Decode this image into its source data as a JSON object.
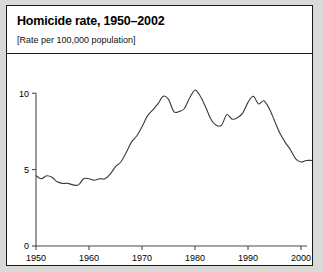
{
  "panel": {
    "title": "Homicide rate, 1950–2002",
    "subtitle": "[Rate per 100,000 population]"
  },
  "chart_data": {
    "type": "line",
    "title": "Homicide rate, 1950–2002",
    "subtitle": "[Rate per 100,000 population]",
    "xlabel": "",
    "ylabel": "",
    "xlim": [
      1950,
      2002
    ],
    "ylim": [
      0,
      10.8
    ],
    "xticks": [
      1950,
      1960,
      1970,
      1980,
      1990,
      2000
    ],
    "xtick_labels": [
      "1950",
      "1960",
      "1970",
      "1980",
      "1990",
      "2000"
    ],
    "yticks": [
      0,
      5,
      10
    ],
    "ytick_labels": [
      "0",
      "5",
      "10"
    ],
    "grid": false,
    "legend": false,
    "line_color": "#3a3a3a",
    "series": [
      {
        "name": "Homicide rate per 100,000 population",
        "x": [
          1950,
          1951,
          1952,
          1953,
          1954,
          1955,
          1956,
          1957,
          1958,
          1959,
          1960,
          1961,
          1962,
          1963,
          1964,
          1965,
          1966,
          1967,
          1968,
          1969,
          1970,
          1971,
          1972,
          1973,
          1974,
          1975,
          1976,
          1977,
          1978,
          1979,
          1980,
          1981,
          1982,
          1983,
          1984,
          1985,
          1986,
          1987,
          1988,
          1989,
          1990,
          1991,
          1992,
          1993,
          1994,
          1995,
          1996,
          1997,
          1998,
          1999,
          2000,
          2001,
          2002
        ],
        "values": [
          4.6,
          4.4,
          4.6,
          4.5,
          4.2,
          4.1,
          4.1,
          4.0,
          4.0,
          4.4,
          4.4,
          4.3,
          4.4,
          4.4,
          4.7,
          5.2,
          5.5,
          6.1,
          6.8,
          7.2,
          7.8,
          8.5,
          8.9,
          9.3,
          9.8,
          9.6,
          8.8,
          8.8,
          9.0,
          9.7,
          10.2,
          9.8,
          9.1,
          8.3,
          7.9,
          7.9,
          8.6,
          8.3,
          8.4,
          8.7,
          9.4,
          9.8,
          9.3,
          9.5,
          9.0,
          8.2,
          7.4,
          6.8,
          6.3,
          5.7,
          5.5,
          5.6,
          5.6
        ]
      }
    ]
  }
}
